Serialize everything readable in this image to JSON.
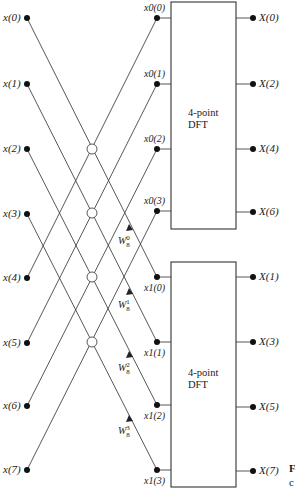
{
  "diagram": {
    "type": "FFT decimation-in-frequency first stage flow graph",
    "inputs": [
      "x(0)",
      "x(1)",
      "x(2)",
      "x(3)",
      "x(4)",
      "x(5)",
      "x(6)",
      "x(7)"
    ],
    "upper_sequence": [
      "x0(0)",
      "x0(1)",
      "x0(2)",
      "x0(3)"
    ],
    "lower_sequence": [
      "x1(0)",
      "x1(1)",
      "x1(2)",
      "x1(3)"
    ],
    "upper_block": {
      "line1": "4-point",
      "line2": "DFT"
    },
    "lower_block": {
      "line1": "4-point",
      "line2": "DFT"
    },
    "upper_outputs": [
      "X(0)",
      "X(2)",
      "X(4)",
      "X(6)"
    ],
    "lower_outputs": [
      "X(1)",
      "X(3)",
      "X(5)",
      "X(7)"
    ],
    "twiddles": [
      {
        "base": "W",
        "sub": "8",
        "sup": "0"
      },
      {
        "base": "W",
        "sub": "8",
        "sup": "1"
      },
      {
        "base": "W",
        "sub": "8",
        "sup": "2"
      },
      {
        "base": "W",
        "sub": "8",
        "sup": "3"
      }
    ],
    "cropped_edge_text": {
      "top": "F",
      "bottom": "c"
    }
  }
}
